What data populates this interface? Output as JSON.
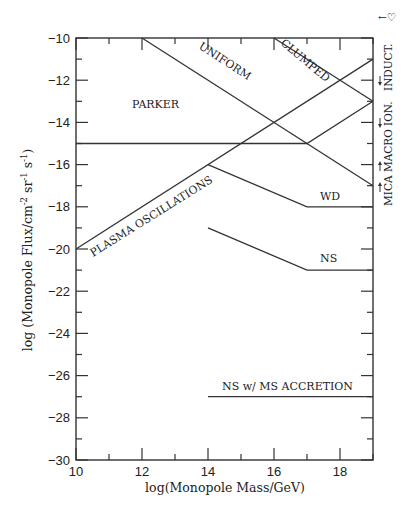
{
  "chart_data": {
    "type": "line",
    "title": "",
    "xlabel": "log(Monopole Mass/GeV)",
    "ylabel": "log (Monopole Flux/cm^-2 sr^-1 s^-1)",
    "ylabel_parts": {
      "main": "log (Monopole Flux/cm",
      "exp1": "-2",
      "mid1": " sr",
      "exp2": "-1",
      "mid2": " s",
      "exp3": "-1",
      "end": ")"
    },
    "xlim": [
      10,
      19
    ],
    "ylim": [
      -30,
      -10
    ],
    "xticks": [
      10,
      12,
      14,
      16,
      18
    ],
    "xtick_labels": [
      "10",
      "12",
      "14",
      "16",
      "18"
    ],
    "yticks": [
      -10,
      -12,
      -14,
      -16,
      -18,
      -20,
      -22,
      -24,
      -26,
      -28,
      -30
    ],
    "ytick_labels": [
      "-10",
      "-12",
      "-14",
      "-16",
      "-18",
      "-20",
      "-22",
      "-24",
      "-26",
      "-28",
      "-30"
    ],
    "grid": false,
    "series": [
      {
        "name": "UNIFORM",
        "x": [
          12,
          19
        ],
        "y": [
          -10,
          -17
        ]
      },
      {
        "name": "CLUMPED",
        "x": [
          16,
          19
        ],
        "y": [
          -10,
          -13
        ]
      },
      {
        "name": "PARKER",
        "x": [
          10,
          17,
          19
        ],
        "y": [
          -15,
          -15,
          -13
        ]
      },
      {
        "name": "PLASMA OSCILLATIONS",
        "x": [
          10,
          19
        ],
        "y": [
          -20,
          -11
        ]
      },
      {
        "name": "WD",
        "x": [
          14,
          17,
          19
        ],
        "y": [
          -16,
          -18,
          -18
        ]
      },
      {
        "name": "NS",
        "x": [
          14,
          17,
          19
        ],
        "y": [
          -19,
          -21,
          -21
        ]
      },
      {
        "name": "NS w/ MS ACCRETION",
        "x": [
          14,
          19
        ],
        "y": [
          -27,
          -27
        ]
      }
    ],
    "annotations": [
      {
        "text": "MICA",
        "y": -17,
        "arrow": "up"
      },
      {
        "text": "MACRO",
        "y": -16,
        "arrow": "up"
      },
      {
        "text": "ION.",
        "y": -14.5,
        "arrow": "down"
      },
      {
        "text": "INDUCT.",
        "y": -12.5,
        "arrow": "down"
      },
      {
        "text": "←♡",
        "position": "top-right"
      }
    ]
  },
  "labels": {
    "uniform": "UNIFORM",
    "clumped": "CLUMPED",
    "parker": "PARKER",
    "plasma": "PLASMA OSCILLATIONS",
    "wd": "WD",
    "ns": "NS",
    "ns_accretion": "NS w/ MS ACCRETION",
    "mica": "MICA",
    "macro": "MACRO",
    "ion": "ION.",
    "induct": "INDUCT.",
    "corner_symbol": "←♡"
  }
}
